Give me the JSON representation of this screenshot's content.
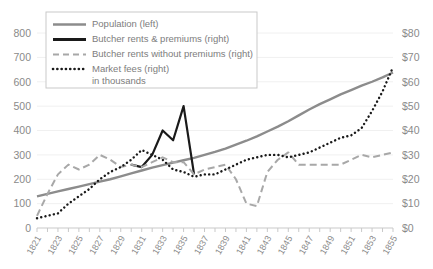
{
  "chart_data": {
    "type": "line",
    "title": "",
    "xlabel": "",
    "ylabel_left": "",
    "ylabel_right": "",
    "grid": true,
    "legend_position": "top-left",
    "x": [
      1821,
      1822,
      1823,
      1824,
      1825,
      1826,
      1827,
      1828,
      1829,
      1830,
      1831,
      1832,
      1833,
      1834,
      1835,
      1836,
      1837,
      1838,
      1839,
      1840,
      1841,
      1842,
      1843,
      1844,
      1845,
      1846,
      1847,
      1848,
      1849,
      1850,
      1851,
      1852,
      1853,
      1854,
      1855
    ],
    "xtick_labels": [
      "1821",
      "1823",
      "1825",
      "1827",
      "1829",
      "1831",
      "1833",
      "1835",
      "1837",
      "1839",
      "1841",
      "1843",
      "1845",
      "1847",
      "1849",
      "1851",
      "1853",
      "1855"
    ],
    "ylim_left": [
      0,
      800
    ],
    "ytick_labels_left": [
      "0",
      "100",
      "200",
      "300",
      "400",
      "500",
      "600",
      "700",
      "800"
    ],
    "ytick_values_left": [
      0,
      100,
      200,
      300,
      400,
      500,
      600,
      700,
      800
    ],
    "ylim_right": [
      0,
      80
    ],
    "ytick_labels_right": [
      "$0",
      "$10",
      "$20",
      "$30",
      "$40",
      "$50",
      "$60",
      "$70",
      "$80"
    ],
    "ytick_values_right": [
      0,
      10,
      20,
      30,
      40,
      50,
      60,
      70,
      80
    ],
    "series": [
      {
        "name": "Population (left)",
        "axis": "left",
        "style": "solid",
        "color": "#8c8c8c",
        "width": 2.4,
        "values": [
          130,
          140,
          150,
          160,
          170,
          180,
          190,
          200,
          212,
          224,
          236,
          248,
          258,
          268,
          278,
          288,
          300,
          312,
          326,
          342,
          358,
          376,
          396,
          416,
          438,
          462,
          486,
          508,
          528,
          548,
          566,
          584,
          600,
          618,
          638
        ]
      },
      {
        "name": "Butcher rents & premiums (right)",
        "axis": "right",
        "style": "solid",
        "color": "#1a1a1a",
        "width": 2.2,
        "values": [
          null,
          null,
          null,
          null,
          null,
          null,
          null,
          null,
          null,
          26.0,
          25.0,
          30.0,
          40.0,
          36.0,
          50.0,
          22.0,
          null,
          null,
          null,
          null,
          null,
          null,
          null,
          null,
          null,
          null,
          null,
          null,
          null,
          null,
          null,
          null,
          null,
          null,
          null
        ]
      },
      {
        "name": "Butcher rents without premiums (right)",
        "axis": "right",
        "style": "dashed",
        "color": "#a8a8a8",
        "width": 2.0,
        "values": [
          5.0,
          14.0,
          22.0,
          26.0,
          24.0,
          26.0,
          30.0,
          28.0,
          25.0,
          26.0,
          25.0,
          27.0,
          29.0,
          27.0,
          27.0,
          22.0,
          24.0,
          25.0,
          26.0,
          20.0,
          10.0,
          9.0,
          23.0,
          28.0,
          31.0,
          26.0,
          26.0,
          26.0,
          26.0,
          26.0,
          28.0,
          30.0,
          29.0,
          30.0,
          31.0
        ]
      },
      {
        "name": "Market fees (right)",
        "axis": "right",
        "style": "dotted",
        "color": "#1a1a1a",
        "width": 2.4,
        "values": [
          4.0,
          5.0,
          6.0,
          10.0,
          13.0,
          16.0,
          20.0,
          23.0,
          25.0,
          28.0,
          32.0,
          30.0,
          28.0,
          24.0,
          23.0,
          21.0,
          22.0,
          22.0,
          24.0,
          26.0,
          28.0,
          29.0,
          30.0,
          30.0,
          29.0,
          30.0,
          31.0,
          33.0,
          35.0,
          37.0,
          38.0,
          41.0,
          48.0,
          56.0,
          66.0
        ]
      }
    ],
    "legend": [
      {
        "label": "Population (left)",
        "swatch": "solid-gray"
      },
      {
        "label": "Butcher rents & premiums (right)",
        "swatch": "solid-black"
      },
      {
        "label": "Butcher rents without premiums (right)",
        "swatch": "dashed-gray"
      },
      {
        "label": "Market fees (right)",
        "swatch": "dotted-black"
      },
      {
        "label": "in thousands",
        "swatch": "none"
      }
    ]
  }
}
